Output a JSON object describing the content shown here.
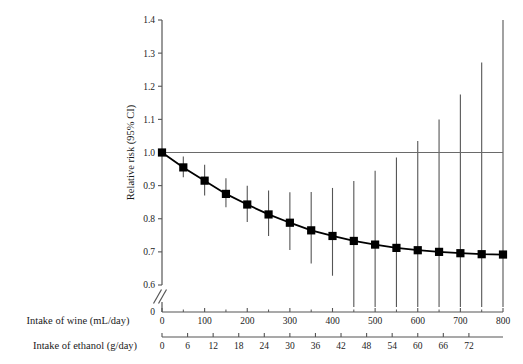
{
  "chart_data": {
    "type": "line",
    "title": "",
    "subtitle": "",
    "ylabel": "Relative risk (95% CI)",
    "ylim": [
      0.6,
      1.4
    ],
    "yticks": [
      0.6,
      0.7,
      0.8,
      0.9,
      1.0,
      1.1,
      1.2,
      1.3,
      1.4
    ],
    "ytick_labels": [
      "0.6",
      "0.7",
      "0.8",
      "0.9",
      "1.0",
      "1.1",
      "1.2",
      "1.3",
      "1.4"
    ],
    "y_axis_break": true,
    "y_origin_label": "0",
    "grid": false,
    "legend": "none",
    "reference_line": {
      "y": 1.0,
      "label": ""
    },
    "xlabel_primary": "Intake of wine (mL/day)",
    "xlabel_secondary": "Intake of ethanol (g/day)",
    "xlim": [
      0,
      800
    ],
    "xticks": [
      0,
      100,
      200,
      300,
      400,
      500,
      600,
      700,
      800
    ],
    "xtick_labels": [
      "0",
      "100",
      "200",
      "300",
      "400",
      "500",
      "600",
      "700",
      "800"
    ],
    "xticks_minor": [
      50,
      150,
      250,
      350,
      450,
      550,
      650,
      750
    ],
    "x_secondary_lim": [
      0,
      72
    ],
    "x_secondary_ticks": [
      0,
      6,
      12,
      18,
      24,
      30,
      36,
      42,
      48,
      54,
      60,
      66,
      72
    ],
    "x_secondary_tick_labels": [
      "0",
      "6",
      "12",
      "18",
      "24",
      "30",
      "36",
      "42",
      "48",
      "54",
      "60",
      "66",
      "72"
    ],
    "x": [
      0,
      50,
      100,
      150,
      200,
      250,
      300,
      350,
      400,
      450,
      500,
      550,
      600,
      650,
      700,
      750,
      800
    ],
    "values": [
      1.0,
      0.955,
      0.915,
      0.875,
      0.843,
      0.813,
      0.788,
      0.765,
      0.748,
      0.733,
      0.722,
      0.712,
      0.705,
      0.7,
      0.696,
      0.693,
      0.692
    ],
    "ci_lower": [
      1.0,
      0.925,
      0.87,
      0.835,
      0.79,
      0.748,
      0.706,
      0.665,
      0.628,
      0.6,
      0.6,
      0.6,
      0.6,
      0.6,
      0.6,
      0.6,
      0.6
    ],
    "ci_upper": [
      1.0,
      0.988,
      0.963,
      0.922,
      0.9,
      0.885,
      0.88,
      0.881,
      0.893,
      0.914,
      0.945,
      0.985,
      1.035,
      1.1,
      1.175,
      1.272,
      1.4
    ],
    "series_name": "Relative risk",
    "marker": "square",
    "marker_color": "#000000",
    "line_color": "#000000",
    "errorbar_color": "#555555"
  },
  "colors": {
    "background": "#ffffff",
    "axis": "#555555",
    "data": "#000000",
    "text": "#1a1a1a"
  }
}
